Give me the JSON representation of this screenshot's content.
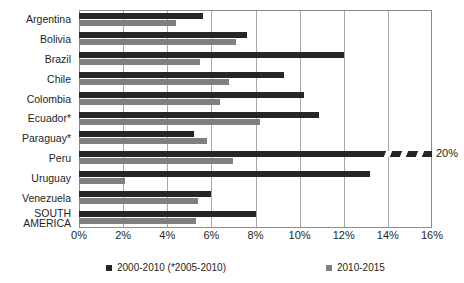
{
  "chart_data": {
    "type": "bar",
    "orientation": "horizontal",
    "title": "",
    "xlabel": "",
    "ylabel": "",
    "xlim": [
      0,
      16
    ],
    "xticks": [
      "0%",
      "2%",
      "4%",
      "6%",
      "8%",
      "10%",
      "12%",
      "14%",
      "16%"
    ],
    "xtick_values": [
      0,
      2,
      4,
      6,
      8,
      10,
      12,
      14,
      16
    ],
    "grid": true,
    "legend_position": "bottom",
    "categories": [
      "Argentina",
      "Bolivia",
      "Brazil",
      "Chile",
      "Colombia",
      "Ecuador*",
      "Paraguay*",
      "Peru",
      "Uruguay",
      "Venezuela",
      "SOUTH AMERICA"
    ],
    "series": [
      {
        "name": "2000-2010 (*2005-2010)",
        "color": "#262626",
        "values": [
          5.6,
          7.6,
          12.0,
          9.3,
          10.2,
          10.9,
          5.2,
          20.0,
          13.2,
          6.0,
          8.0
        ]
      },
      {
        "name": "2010-2015",
        "color": "#808080",
        "values": [
          4.4,
          7.1,
          5.5,
          6.8,
          6.4,
          8.2,
          5.8,
          7.0,
          2.1,
          5.4,
          5.3
        ]
      }
    ],
    "annotations": [
      {
        "label": "20%",
        "target_category": "Peru",
        "target_series": "2000-2010 (*2005-2010)",
        "note": "axis-break: bar truncated at plot edge with zigzag break"
      }
    ]
  },
  "legend": {
    "items": [
      {
        "label": "2000-2010 (*2005-2010)",
        "color": "#262626"
      },
      {
        "label": "2010-2015",
        "color": "#808080"
      }
    ]
  },
  "axis": {
    "break_label": "20%"
  }
}
